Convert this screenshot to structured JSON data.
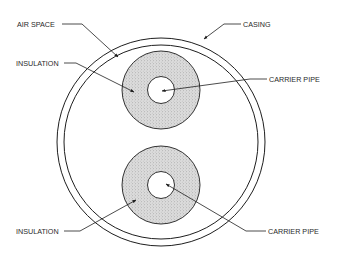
{
  "colors": {
    "line": "#1e1e1e",
    "insulation_fill": "#d9d9d9",
    "background": "#ffffff"
  },
  "labels": {
    "air_space": "AIR SPACE",
    "insulation_top": "INSULATION",
    "casing": "CASING",
    "carrier_pipe_top": "CARRIER PIPE",
    "insulation_bottom": "INSULATION",
    "carrier_pipe_bottom": "CARRIER PIPE"
  },
  "geometry": {
    "casing": {
      "cx": 161,
      "cy": 142,
      "r_outer": 104,
      "r_inner": 97
    },
    "pipe_top": {
      "cx": 161,
      "cy": 90,
      "r_insulation": 39,
      "r_pipe": 13.5
    },
    "pipe_bottom": {
      "cx": 161,
      "cy": 185,
      "r_insulation": 39,
      "r_pipe": 13.5
    }
  }
}
